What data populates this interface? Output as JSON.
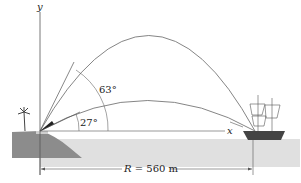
{
  "diagram": {
    "axes": {
      "x_label": "x",
      "y_label": "y"
    },
    "angles": [
      {
        "label": "63°",
        "value": 63
      },
      {
        "label": "27°",
        "value": 27
      }
    ],
    "range": {
      "symbol": "R",
      "text": "= 560 m",
      "value_m": 560
    },
    "elements": [
      "cannon on shore",
      "palm tree",
      "ship",
      "sea",
      "two trajectories"
    ],
    "colors": {
      "line": "#555555",
      "land": "#8a8a8a",
      "sea": "#dcdcdc",
      "ship": "#444444"
    }
  }
}
